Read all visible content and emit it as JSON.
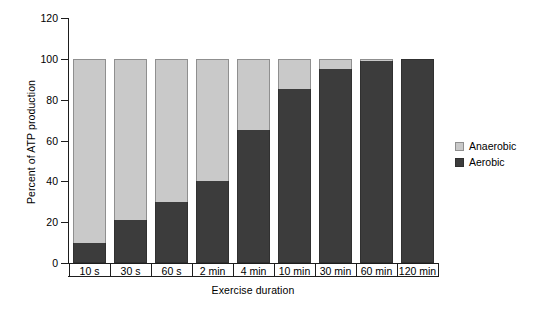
{
  "chart_data": {
    "type": "bar",
    "subtype": "stacked-bar-100",
    "title": "",
    "xlabel": "Exercise duration",
    "ylabel": "Percent of ATP production",
    "categories": [
      "10 s",
      "30 s",
      "60 s",
      "2 min",
      "4 min",
      "10 min",
      "30 min",
      "60 min",
      "120 min"
    ],
    "series": [
      {
        "name": "Aerobic",
        "color": "#3c3c3c",
        "values": [
          10,
          21,
          30,
          40,
          65,
          85,
          95,
          99,
          100
        ]
      },
      {
        "name": "Anaerobic",
        "color": "#c9c9c9",
        "values": [
          90,
          79,
          70,
          60,
          35,
          15,
          5,
          1,
          0
        ]
      }
    ],
    "ylim": [
      0,
      120
    ],
    "yticks": [
      0,
      20,
      40,
      60,
      80,
      100,
      120
    ],
    "ytick_labels": [
      "0",
      "20",
      "40",
      "60",
      "80",
      "100",
      "120"
    ],
    "grid": false,
    "legend_position": "right",
    "legend_entries": [
      "Anaerobic",
      "Aerobic"
    ]
  },
  "legend": {
    "items": [
      {
        "label": "Anaerobic",
        "swatch": "anaerobic-swatch"
      },
      {
        "label": "Aerobic",
        "swatch": "aerobic-swatch"
      }
    ]
  },
  "colors": {
    "anaerobic": "#c9c9c9",
    "aerobic": "#3c3c3c",
    "axis": "#1d1d1d",
    "background": "#ffffff"
  }
}
